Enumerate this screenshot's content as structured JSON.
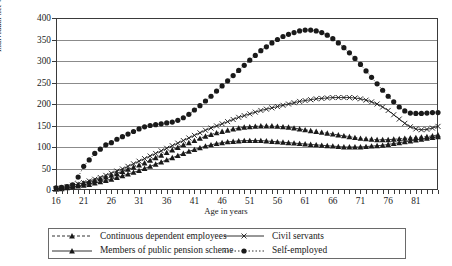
{
  "chart_data": {
    "type": "line",
    "title": "",
    "xlabel": "Age in years",
    "ylabel": "Individual net worth in 1,000 euros",
    "xlim": [
      16,
      85
    ],
    "ylim": [
      0,
      400
    ],
    "ytick_step": 50,
    "yticks": [
      0,
      50,
      100,
      150,
      200,
      250,
      300,
      350,
      400
    ],
    "xticks": [
      16,
      21,
      26,
      31,
      36,
      41,
      46,
      51,
      56,
      61,
      66,
      71,
      76,
      81
    ],
    "grid": true,
    "legend_position": "bottom",
    "x": [
      16,
      17,
      18,
      19,
      20,
      21,
      22,
      23,
      24,
      25,
      26,
      27,
      28,
      29,
      30,
      31,
      32,
      33,
      34,
      35,
      36,
      37,
      38,
      39,
      40,
      41,
      42,
      43,
      44,
      45,
      46,
      47,
      48,
      49,
      50,
      51,
      52,
      53,
      54,
      55,
      56,
      57,
      58,
      59,
      60,
      61,
      62,
      63,
      64,
      65,
      66,
      67,
      68,
      69,
      70,
      71,
      72,
      73,
      74,
      75,
      76,
      77,
      78,
      79,
      80,
      81,
      82,
      83,
      84,
      85
    ],
    "series": [
      {
        "name": "Continuous dependent employees",
        "marker": "triangle",
        "line": "dashed",
        "values": [
          3,
          5,
          7,
          10,
          13,
          16,
          19,
          22,
          26,
          30,
          34,
          38,
          43,
          48,
          53,
          58,
          63,
          69,
          75,
          81,
          87,
          93,
          99,
          105,
          110,
          115,
          120,
          125,
          129,
          133,
          136,
          139,
          142,
          144,
          146,
          147,
          148,
          149,
          149,
          149,
          148,
          147,
          146,
          144,
          142,
          140,
          138,
          136,
          134,
          132,
          130,
          128,
          126,
          124,
          122,
          120,
          119,
          118,
          117,
          117,
          117,
          118,
          119,
          120,
          121,
          122,
          123,
          124,
          126,
          128
        ]
      },
      {
        "name": "Members of public pension scheme",
        "marker": "triangle",
        "line": "solid",
        "values": [
          2,
          3,
          5,
          7,
          9,
          11,
          13,
          16,
          19,
          22,
          25,
          29,
          33,
          37,
          41,
          45,
          50,
          55,
          60,
          65,
          70,
          75,
          80,
          85,
          90,
          94,
          98,
          102,
          105,
          108,
          110,
          112,
          113,
          114,
          115,
          115,
          115,
          115,
          114,
          113,
          112,
          111,
          110,
          109,
          108,
          107,
          106,
          105,
          104,
          103,
          102,
          101,
          100,
          100,
          100,
          100,
          101,
          102,
          103,
          104,
          106,
          108,
          110,
          112,
          114,
          116,
          118,
          120,
          122,
          124
        ]
      },
      {
        "name": "Civil servants",
        "marker": "x",
        "line": "solid",
        "values": [
          3,
          5,
          8,
          11,
          14,
          17,
          21,
          25,
          29,
          34,
          39,
          44,
          49,
          55,
          61,
          67,
          73,
          79,
          85,
          91,
          97,
          103,
          109,
          115,
          121,
          127,
          133,
          139,
          144,
          149,
          154,
          159,
          164,
          169,
          173,
          177,
          181,
          185,
          188,
          191,
          194,
          197,
          200,
          203,
          206,
          208,
          210,
          212,
          213,
          214,
          215,
          215,
          215,
          215,
          214,
          212,
          209,
          205,
          200,
          193,
          185,
          175,
          165,
          155,
          147,
          142,
          140,
          141,
          144,
          148
        ]
      },
      {
        "name": "Self-employed",
        "marker": "circle",
        "line": "dotted",
        "values": [
          5,
          6,
          8,
          12,
          30,
          55,
          70,
          85,
          95,
          105,
          110,
          118,
          124,
          130,
          136,
          142,
          147,
          150,
          152,
          154,
          156,
          158,
          162,
          168,
          176,
          186,
          196,
          207,
          218,
          230,
          242,
          254,
          266,
          278,
          290,
          302,
          313,
          324,
          333,
          342,
          350,
          357,
          362,
          366,
          370,
          372,
          372,
          370,
          366,
          360,
          352,
          342,
          331,
          319,
          306,
          292,
          277,
          262,
          247,
          232,
          218,
          205,
          193,
          184,
          179,
          178,
          178,
          179,
          180,
          180
        ]
      }
    ]
  },
  "legend": {
    "entries": [
      {
        "label": "Continuous dependent employees",
        "key": "dashed-triangle-key"
      },
      {
        "label": "Civil servants",
        "key": "solid-x-key"
      },
      {
        "label": "Members of public pension scheme",
        "key": "solid-triangle-key"
      },
      {
        "label": "Self-employed",
        "key": "dotted-circle-key"
      }
    ]
  },
  "colors": {
    "ink": "#1a1a1a",
    "axis": "#3a3a3a",
    "grid": "#8b8b8b",
    "series": "#1a1a1a"
  }
}
